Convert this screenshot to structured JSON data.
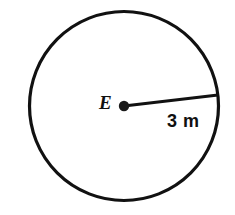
{
  "figure": {
    "kind": "circle-with-radius-diagram",
    "background_color": "#FFFFFF",
    "stroke_color": "#111111",
    "circle": {
      "center_x": 124,
      "center_y": 106,
      "radius": 95,
      "stroke_width": 3.2,
      "fill": "none"
    },
    "center_point": {
      "label": "E",
      "dot_radius": 5.2,
      "dot_color": "#1A1A1A",
      "x": 124,
      "y": 106
    },
    "radius_segment": {
      "from_x": 124,
      "from_y": 106,
      "to_x": 218,
      "to_y": 95,
      "stroke_width": 3.0,
      "measure_label": "3 m",
      "measure_value": "3",
      "measure_unit": "m"
    }
  }
}
